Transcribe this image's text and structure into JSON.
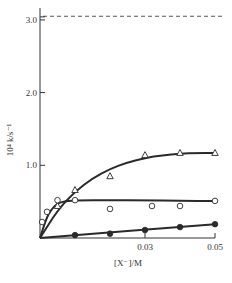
{
  "chart_data": {
    "type": "scatter",
    "title": "",
    "xlabel": "[X⁻]/M",
    "ylabel": "10⁴ k/s⁻¹",
    "xlim": [
      0,
      0.05
    ],
    "ylim": [
      0,
      3.2
    ],
    "x_ticks": [
      {
        "value": 0.03,
        "label": "0.03"
      },
      {
        "value": 0.05,
        "label": "0.05"
      }
    ],
    "y_ticks": [
      {
        "value": 1.0,
        "label": "1.0"
      },
      {
        "value": 2.0,
        "label": "2.0"
      },
      {
        "value": 3.0,
        "label": "3.0"
      }
    ],
    "grid": false,
    "legend": null,
    "reference_line": {
      "y": 3.05,
      "style": "dashed"
    },
    "series": [
      {
        "name": "open-triangle",
        "marker": "triangle-open",
        "points": [
          {
            "x": 0.005,
            "y": 0.44
          },
          {
            "x": 0.01,
            "y": 0.66
          },
          {
            "x": 0.02,
            "y": 0.85
          },
          {
            "x": 0.03,
            "y": 1.14
          },
          {
            "x": 0.04,
            "y": 1.17
          },
          {
            "x": 0.05,
            "y": 1.17
          }
        ],
        "fit_curve": [
          {
            "x": 0,
            "y": 0
          },
          {
            "x": 0.005,
            "y": 0.38
          },
          {
            "x": 0.01,
            "y": 0.64
          },
          {
            "x": 0.015,
            "y": 0.82
          },
          {
            "x": 0.02,
            "y": 0.95
          },
          {
            "x": 0.025,
            "y": 1.04
          },
          {
            "x": 0.03,
            "y": 1.1
          },
          {
            "x": 0.035,
            "y": 1.14
          },
          {
            "x": 0.04,
            "y": 1.16
          },
          {
            "x": 0.045,
            "y": 1.17
          },
          {
            "x": 0.05,
            "y": 1.17
          }
        ]
      },
      {
        "name": "open-circle",
        "marker": "circle-open",
        "points": [
          {
            "x": 0.0006,
            "y": 0.22
          },
          {
            "x": 0.002,
            "y": 0.36
          },
          {
            "x": 0.005,
            "y": 0.52
          },
          {
            "x": 0.01,
            "y": 0.52
          },
          {
            "x": 0.02,
            "y": 0.4
          },
          {
            "x": 0.032,
            "y": 0.44
          },
          {
            "x": 0.04,
            "y": 0.44
          },
          {
            "x": 0.05,
            "y": 0.51
          }
        ],
        "fit_curve": [
          {
            "x": 0,
            "y": 0
          },
          {
            "x": 0.002,
            "y": 0.3
          },
          {
            "x": 0.004,
            "y": 0.44
          },
          {
            "x": 0.006,
            "y": 0.5
          },
          {
            "x": 0.01,
            "y": 0.52
          },
          {
            "x": 0.02,
            "y": 0.52
          },
          {
            "x": 0.03,
            "y": 0.52
          },
          {
            "x": 0.04,
            "y": 0.51
          },
          {
            "x": 0.05,
            "y": 0.51
          }
        ]
      },
      {
        "name": "filled-circle",
        "marker": "circle-filled",
        "points": [
          {
            "x": 0.01,
            "y": 0.04
          },
          {
            "x": 0.02,
            "y": 0.06
          },
          {
            "x": 0.03,
            "y": 0.11
          },
          {
            "x": 0.04,
            "y": 0.15
          },
          {
            "x": 0.05,
            "y": 0.19
          }
        ],
        "fit_curve": [
          {
            "x": 0,
            "y": 0
          },
          {
            "x": 0.05,
            "y": 0.19
          }
        ]
      }
    ]
  },
  "colors": {
    "ink": "#2a2a2a",
    "axis": "#333333",
    "dash": "#555555"
  }
}
